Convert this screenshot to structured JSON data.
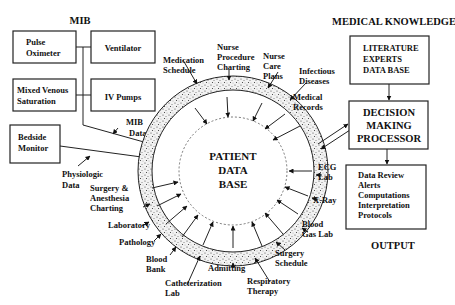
{
  "headings": {
    "mib": "MIB",
    "medical_knowledge": "MEDICAL KNOWLEDGE",
    "output": "OUTPUT"
  },
  "devices": {
    "pulse_oximeter": [
      "Pulse",
      "Oximeter"
    ],
    "ventilator": "Ventilator",
    "mixed_venous": [
      "Mixed Venous",
      "Saturation"
    ],
    "iv_pumps": "IV Pumps",
    "bedside_monitor": [
      "Bedside",
      "Monitor"
    ]
  },
  "labels": {
    "mib_data": [
      "MIB",
      "Data"
    ],
    "physiologic_data": [
      "Physiologic",
      "Data"
    ],
    "surgery_anesthesia": [
      "Surgery &",
      "Anesthesia",
      "Charting"
    ],
    "laboratory": "Laboratory",
    "pathology": "Pathology",
    "blood_bank": [
      "Blood",
      "Bank"
    ],
    "catheterization_lab": [
      "Catheterization",
      "Lab"
    ],
    "admitting": "Admitting",
    "respiratory_therapy": [
      "Respiratory",
      "Therapy"
    ],
    "surgery_schedule": [
      "Surgery",
      "Schedule"
    ],
    "blood_gas_lab": [
      "Blood",
      "Gas Lab"
    ],
    "x_ray": "X-Ray",
    "ecg_lab": [
      "ECG",
      "Lab"
    ],
    "medical_records": [
      "Medical",
      "Records"
    ],
    "infectious_diseases": [
      "Infectious",
      "Diseases"
    ],
    "nurse_care_plans": [
      "Nurse",
      "Care",
      "Plans"
    ],
    "nurse_procedure_charting": [
      "Nurse",
      "Procedure",
      "Charting"
    ],
    "medication_schedule": [
      "Medication",
      "Schedule"
    ]
  },
  "center": [
    "PATIENT",
    "DATA",
    "BASE"
  ],
  "knowledge_box": [
    "LITERATURE",
    "EXPERTS",
    "DATA BASE"
  ],
  "processor_box": [
    "DECISION",
    "MAKING",
    "PROCESSOR"
  ],
  "output_box": [
    "Data Review",
    "Alerts",
    "Computations",
    "Interpretation",
    "Protocols"
  ]
}
